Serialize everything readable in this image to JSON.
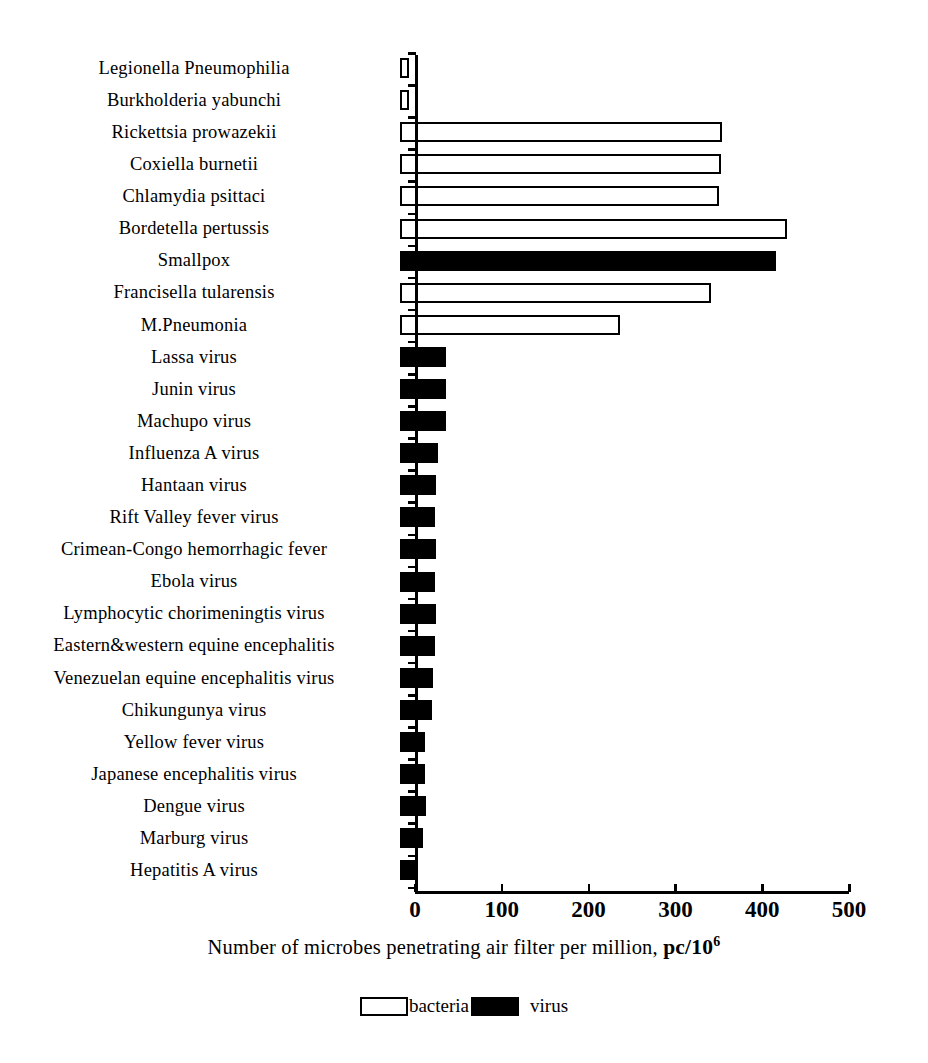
{
  "chart_data": {
    "type": "bar",
    "orientation": "horizontal",
    "title": "",
    "xlabel": "Number of microbes penetrating air filter per million, pc/10^6",
    "ylabel": "",
    "xlim": [
      0,
      500
    ],
    "xticks": [
      0,
      100,
      200,
      300,
      400,
      500
    ],
    "xtick_labels": [
      "0",
      "100",
      "200",
      "300",
      "400",
      "500"
    ],
    "grid": false,
    "legend_position": "bottom-center",
    "legend": [
      {
        "key": "bacteria",
        "label": "bacteria",
        "color": "#ffffff",
        "edge": "#000000"
      },
      {
        "key": "virus",
        "label": "virus",
        "color": "#000000",
        "edge": "#000000"
      }
    ],
    "categories": [
      "Legionella Pneumophilia",
      "Burkholderia yabunchi",
      "Rickettsia prowazekii",
      "Coxiella burnetii",
      "Chlamydia psittaci",
      "Bordetella pertussis",
      "Smallpox",
      "Francisella tularensis",
      "M.Pneumonia",
      "Lassa virus",
      "Junin virus",
      "Machupo virus",
      "Influenza A virus",
      "Hantaan virus",
      "Rift Valley fever virus",
      "Crimean-Congo hemorrhagic fever",
      "Ebola virus",
      "Lymphocytic chorimeningtis virus",
      "Eastern&western equine encephalitis",
      "Venezuelan equine encephalitis virus",
      "Chikungunya virus",
      "Yellow fever virus",
      "Japanese encephalitis virus",
      "Dengue virus",
      "Marburg virus",
      "Hepatitis A virus"
    ],
    "values": [
      6,
      6,
      371,
      370,
      368,
      446,
      433,
      358,
      253,
      53,
      53,
      53,
      44,
      41,
      40,
      41,
      40,
      41,
      40,
      38,
      37,
      29,
      29,
      30,
      27,
      21
    ],
    "groups": [
      "bacteria",
      "bacteria",
      "bacteria",
      "bacteria",
      "bacteria",
      "bacteria",
      "virus",
      "bacteria",
      "bacteria",
      "virus",
      "virus",
      "virus",
      "virus",
      "virus",
      "virus",
      "virus",
      "virus",
      "virus",
      "virus",
      "virus",
      "virus",
      "virus",
      "virus",
      "virus",
      "virus",
      "virus"
    ],
    "bars": [
      {
        "category": "Legionella Pneumophilia",
        "value": 6,
        "group": "bacteria"
      },
      {
        "category": "Burkholderia yabunchi",
        "value": 6,
        "group": "bacteria"
      },
      {
        "category": "Rickettsia prowazekii",
        "value": 371,
        "group": "bacteria"
      },
      {
        "category": "Coxiella burnetii",
        "value": 370,
        "group": "bacteria"
      },
      {
        "category": "Chlamydia psittaci",
        "value": 368,
        "group": "bacteria"
      },
      {
        "category": "Bordetella pertussis",
        "value": 446,
        "group": "bacteria"
      },
      {
        "category": "Smallpox",
        "value": 433,
        "group": "virus"
      },
      {
        "category": "Francisella tularensis",
        "value": 358,
        "group": "bacteria"
      },
      {
        "category": "M.Pneumonia",
        "value": 253,
        "group": "bacteria"
      },
      {
        "category": "Lassa virus",
        "value": 53,
        "group": "virus"
      },
      {
        "category": "Junin virus",
        "value": 53,
        "group": "virus"
      },
      {
        "category": "Machupo virus",
        "value": 53,
        "group": "virus"
      },
      {
        "category": "Influenza A virus",
        "value": 44,
        "group": "virus"
      },
      {
        "category": "Hantaan virus",
        "value": 41,
        "group": "virus"
      },
      {
        "category": "Rift Valley fever virus",
        "value": 40,
        "group": "virus"
      },
      {
        "category": "Crimean-Congo hemorrhagic fever",
        "value": 41,
        "group": "virus"
      },
      {
        "category": "Ebola virus",
        "value": 40,
        "group": "virus"
      },
      {
        "category": "Lymphocytic chorimeningtis virus",
        "value": 41,
        "group": "virus"
      },
      {
        "category": "Eastern&western equine encephalitis",
        "value": 40,
        "group": "virus"
      },
      {
        "category": "Venezuelan equine encephalitis virus",
        "value": 38,
        "group": "virus"
      },
      {
        "category": "Chikungunya virus",
        "value": 37,
        "group": "virus"
      },
      {
        "category": "Yellow fever virus",
        "value": 29,
        "group": "virus"
      },
      {
        "category": "Japanese encephalitis virus",
        "value": 29,
        "group": "virus"
      },
      {
        "category": "Dengue virus",
        "value": 30,
        "group": "virus"
      },
      {
        "category": "Marburg virus",
        "value": 27,
        "group": "virus"
      },
      {
        "category": "Hepatitis A virus",
        "value": 21,
        "group": "virus"
      }
    ]
  },
  "axis": {
    "title_main": "Number of microbes penetrating air filter per million, ",
    "title_unit": "pc/10",
    "title_exponent": "6"
  },
  "colors": {
    "bacteria_fill": "#ffffff",
    "virus_fill": "#000000",
    "axis": "#000000",
    "background": "#ffffff"
  }
}
